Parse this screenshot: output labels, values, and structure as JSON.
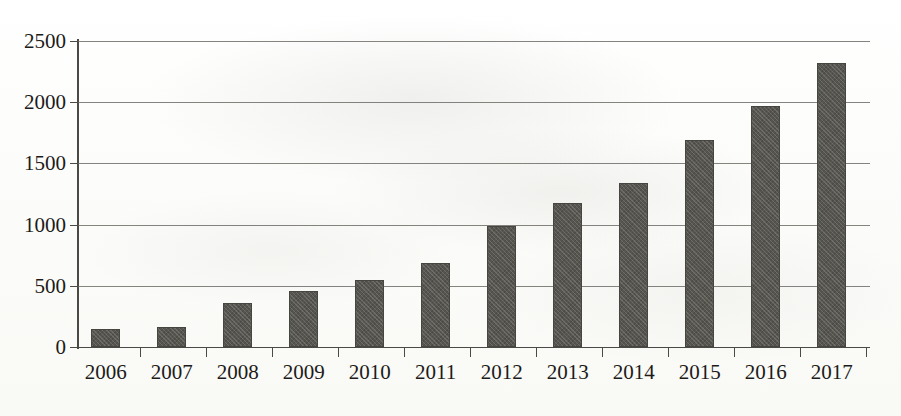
{
  "chart_data": {
    "type": "bar",
    "title": "",
    "subtitle": "",
    "xlabel": "",
    "ylabel": "",
    "categories": [
      "2006",
      "2007",
      "2008",
      "2009",
      "2010",
      "2011",
      "2012",
      "2013",
      "2014",
      "2015",
      "2016",
      "2017"
    ],
    "values": [
      150,
      165,
      360,
      460,
      545,
      685,
      985,
      1175,
      1340,
      1690,
      1970,
      2320
    ],
    "series": [
      {
        "name": "",
        "values": [
          150,
          165,
          360,
          460,
          545,
          685,
          985,
          1175,
          1340,
          1690,
          1970,
          2320
        ]
      }
    ],
    "ylim": [
      0,
      2500
    ],
    "yticks": [
      0,
      500,
      1000,
      1500,
      2000,
      2500
    ],
    "ytick_labels": [
      "0",
      "500",
      "1000",
      "1500",
      "2000",
      "2500"
    ],
    "xtick_labels": [
      "2006",
      "2007",
      "2008",
      "2009",
      "2010",
      "2011",
      "2012",
      "2013",
      "2014",
      "2015",
      "2016",
      "2017"
    ],
    "grid": true,
    "grid_axis": "y",
    "legend": false,
    "legend_position": "none",
    "annotations": [],
    "bar_color": "#56554f",
    "axis_color": "#4a4945",
    "background_color": "#fdfdfb"
  }
}
